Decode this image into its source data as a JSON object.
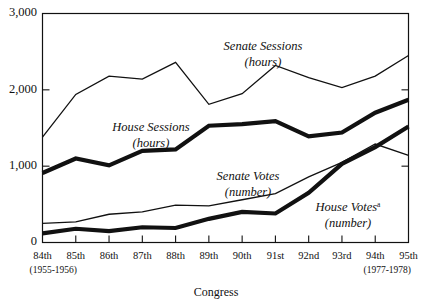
{
  "chart_data": {
    "type": "line",
    "title": "",
    "xlabel": "Congress",
    "ylabel": "",
    "ylim": [
      0,
      3000
    ],
    "grid": false,
    "legend_position": "inline-annotations",
    "categories": [
      "84th",
      "85th",
      "86th",
      "87th",
      "88th",
      "89th",
      "90th",
      "91st",
      "92nd",
      "93rd",
      "94th",
      "95th"
    ],
    "x_tick_labels": [
      "84th",
      "85th",
      "86th",
      "87th",
      "88th",
      "89th",
      "90th",
      "91st",
      "92nd",
      "93rd",
      "94th",
      "95th"
    ],
    "x_sub_label_first": "(1955-1956)",
    "x_sub_label_last": "(1977-1978)",
    "y_tick_labels": [
      "3,000",
      "2,000",
      "1,000",
      "0"
    ],
    "y_tick_values": [
      3000,
      2000,
      1000,
      0
    ],
    "series": [
      {
        "name": "Senate Sessions",
        "unit": "(hours)",
        "style": "thin",
        "values": [
          1380,
          1940,
          2180,
          2140,
          2360,
          1810,
          1950,
          2320,
          2160,
          2030,
          2180,
          2450
        ]
      },
      {
        "name": "House Sessions",
        "unit": "(hours)",
        "style": "thick",
        "values": [
          910,
          1100,
          1010,
          1200,
          1220,
          1530,
          1550,
          1590,
          1390,
          1440,
          1700,
          1870
        ]
      },
      {
        "name": "Senate Votes",
        "unit": "(number)",
        "style": "thin",
        "values": [
          250,
          270,
          370,
          400,
          490,
          480,
          560,
          640,
          860,
          1050,
          1290,
          1140
        ]
      },
      {
        "name": "House Votes",
        "unit": "(number)",
        "style": "thick",
        "footnote_marker": "a",
        "values": [
          120,
          180,
          150,
          200,
          190,
          310,
          400,
          380,
          650,
          1030,
          1250,
          1520
        ]
      }
    ],
    "annotations": [
      {
        "id": "senate-sessions",
        "line1": "Senate Sessions",
        "line2": "(hours)"
      },
      {
        "id": "house-sessions",
        "line1": "House Sessions",
        "line2": "(hours)"
      },
      {
        "id": "senate-votes",
        "line1": "Senate Votes",
        "line2": "(number)"
      },
      {
        "id": "house-votes",
        "line1": "House Votes",
        "line2": "(number)",
        "marker": "a"
      }
    ]
  }
}
